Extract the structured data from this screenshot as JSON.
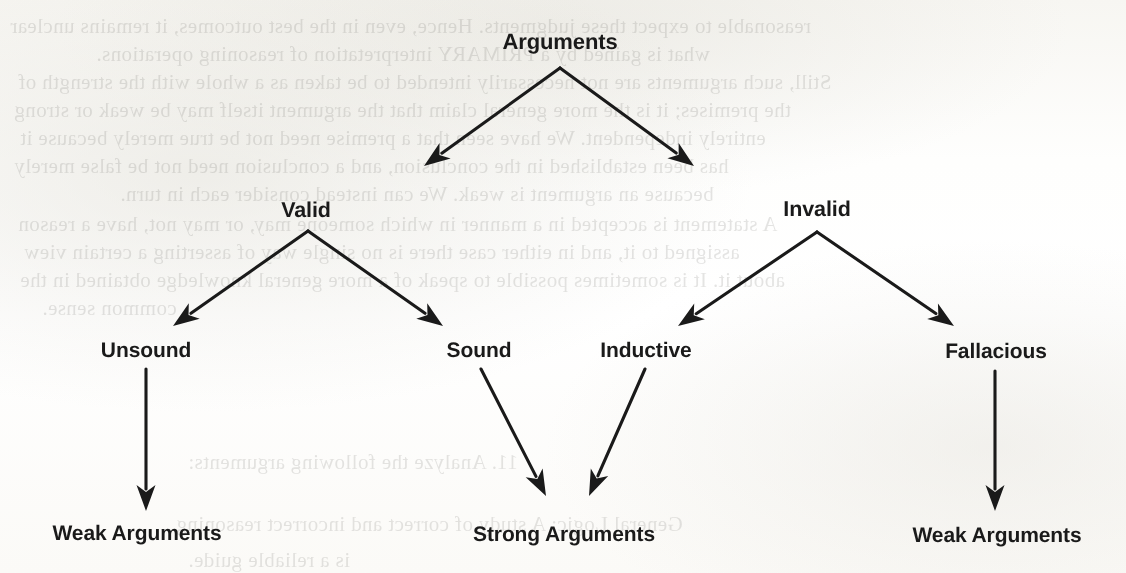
{
  "page": {
    "width": 1126,
    "height": 573,
    "background_color": "#fdfdfb",
    "ink_color": "#1a1a1a"
  },
  "diagram": {
    "type": "tree",
    "title": "Arguments",
    "nodes": [
      {
        "id": "arguments",
        "label": "Arguments",
        "level": 1,
        "x": 560,
        "y": 42
      },
      {
        "id": "valid",
        "label": "Valid",
        "level": 2,
        "x": 306,
        "y": 210
      },
      {
        "id": "invalid",
        "label": "Invalid",
        "level": 2,
        "x": 817,
        "y": 209
      },
      {
        "id": "unsound",
        "label": "Unsound",
        "level": 3,
        "x": 146,
        "y": 351
      },
      {
        "id": "sound",
        "label": "Sound",
        "level": 3,
        "x": 479,
        "y": 351
      },
      {
        "id": "inductive",
        "label": "Inductive",
        "level": 3,
        "x": 646,
        "y": 351
      },
      {
        "id": "fallacious",
        "label": "Fallacious",
        "level": 3,
        "x": 996,
        "y": 352
      },
      {
        "id": "weak-arguments-left",
        "label": "Weak Arguments",
        "level": 4,
        "x": 137,
        "y": 534
      },
      {
        "id": "strong-arguments",
        "label": "Strong Arguments",
        "level": 4,
        "x": 564,
        "y": 535
      },
      {
        "id": "weak-arguments-right",
        "label": "Weak Arguments",
        "level": 4,
        "x": 997,
        "y": 536
      }
    ],
    "edges": [
      {
        "id": "arguments-to-valid",
        "from": "arguments",
        "to": "valid",
        "x1": 560,
        "y1": 68,
        "x2": 424,
        "y2": 166
      },
      {
        "id": "arguments-to-invalid",
        "from": "arguments",
        "to": "invalid",
        "x1": 560,
        "y1": 68,
        "x2": 694,
        "y2": 166
      },
      {
        "id": "valid-to-unsound",
        "from": "valid",
        "to": "unsound",
        "x1": 308,
        "y1": 231,
        "x2": 173,
        "y2": 326
      },
      {
        "id": "valid-to-sound",
        "from": "valid",
        "to": "sound",
        "x1": 308,
        "y1": 231,
        "x2": 443,
        "y2": 326
      },
      {
        "id": "invalid-to-inductive",
        "from": "invalid",
        "to": "inductive",
        "x1": 817,
        "y1": 232,
        "x2": 678,
        "y2": 326
      },
      {
        "id": "invalid-to-fallacious",
        "from": "invalid",
        "to": "fallacious",
        "x1": 817,
        "y1": 232,
        "x2": 954,
        "y2": 326
      },
      {
        "id": "unsound-to-weak-left",
        "from": "unsound",
        "to": "weak-arguments-left",
        "x1": 146,
        "y1": 369,
        "x2": 146,
        "y2": 511
      },
      {
        "id": "sound-to-strong",
        "from": "sound",
        "to": "strong-arguments",
        "x1": 481,
        "y1": 369,
        "x2": 546,
        "y2": 496
      },
      {
        "id": "inductive-to-strong",
        "from": "inductive",
        "to": "strong-arguments",
        "x1": 645,
        "y1": 369,
        "x2": 589,
        "y2": 496
      },
      {
        "id": "fallacious-to-weak-right",
        "from": "fallacious",
        "to": "weak-arguments-right",
        "x1": 995,
        "y1": 371,
        "x2": 995,
        "y2": 511
      }
    ]
  },
  "background_bleed_text": [
    {
      "x": 10,
      "y": 14,
      "text": "reasonable to expect these judgments. Hence, even in the best outcomes, it remains unclear"
    },
    {
      "x": 96,
      "y": 42,
      "text": "what is gained by a PRIMARY interpretation of reasoning operations."
    },
    {
      "x": 18,
      "y": 70,
      "text": "Still, such arguments are not necessarily intended to be taken as a whole with the strength of"
    },
    {
      "x": 14,
      "y": 98,
      "text": "the premises; it is the more general claim that the argument itself may be weak or strong"
    },
    {
      "x": 20,
      "y": 126,
      "text": "entirely independent. We have seen that a premise need not be true merely because it"
    },
    {
      "x": 14,
      "y": 154,
      "text": "has been established in the conclusion, and a conclusion need not be false merely"
    },
    {
      "x": 120,
      "y": 182,
      "text": "because an argument is weak. We can instead consider each in turn."
    },
    {
      "x": 18,
      "y": 212,
      "text": "A statement is accepted in a manner in which someone may, or may not, have a reason"
    },
    {
      "x": 24,
      "y": 240,
      "text": "assigned to it, and in either case there is no single way of asserting a certain view"
    },
    {
      "x": 20,
      "y": 268,
      "text": "about it. It is sometimes possible to speak of a more general knowledge obtained in the"
    },
    {
      "x": 42,
      "y": 296,
      "text": "common sense."
    },
    {
      "x": 188,
      "y": 450,
      "text": "11. Analyze the following arguments:"
    },
    {
      "x": 176,
      "y": 512,
      "text": "General Logic: A study of correct and incorrect reasoning"
    },
    {
      "x": 188,
      "y": 548,
      "text": "is a reliable guide."
    }
  ]
}
